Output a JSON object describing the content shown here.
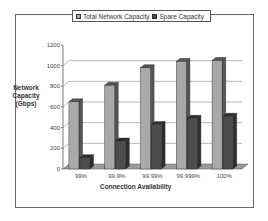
{
  "chart_data": {
    "type": "bar",
    "style": "3d-clustered-column",
    "title": "",
    "xlabel": "Connection Availability",
    "ylabel": "Network Capacity (Gbps)",
    "ylabel_lines": [
      "Network",
      "Capacity",
      "(Gbps)"
    ],
    "ylim": [
      0,
      1200
    ],
    "yticks": [
      0,
      200,
      400,
      600,
      800,
      1000,
      1200
    ],
    "grid": true,
    "legend_position": "top",
    "categories": [
      "99%",
      "99.9%",
      "99.99%",
      "99.999%",
      "100%"
    ],
    "series": [
      {
        "name": "Total Network Capacity",
        "values": [
          650,
          810,
          980,
          1040,
          1050
        ],
        "color": "#a9a9a9",
        "side_color": "#555555"
      },
      {
        "name": "Spare Capacity",
        "values": [
          110,
          270,
          430,
          490,
          510
        ],
        "color": "#4d4d4d",
        "side_color": "#2e2e2e"
      }
    ]
  }
}
